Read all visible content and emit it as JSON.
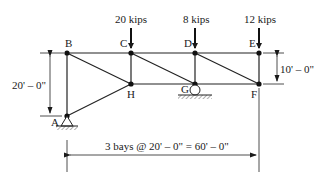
{
  "diagram": {
    "type": "truss",
    "nodes": [
      {
        "id": "A",
        "label": "A",
        "x": 67,
        "y": 116,
        "support": "pin"
      },
      {
        "id": "B",
        "label": "B",
        "x": 67,
        "y": 53
      },
      {
        "id": "C",
        "label": "C",
        "x": 131,
        "y": 53
      },
      {
        "id": "D",
        "label": "D",
        "x": 195,
        "y": 53
      },
      {
        "id": "E",
        "label": "E",
        "x": 259,
        "y": 53
      },
      {
        "id": "F",
        "label": "F",
        "x": 259,
        "y": 84
      },
      {
        "id": "G",
        "label": "G",
        "x": 195,
        "y": 84,
        "support": "roller"
      },
      {
        "id": "H",
        "label": "H",
        "x": 131,
        "y": 84
      }
    ],
    "members": [
      [
        "A",
        "B"
      ],
      [
        "B",
        "C"
      ],
      [
        "C",
        "D"
      ],
      [
        "D",
        "E"
      ],
      [
        "E",
        "F"
      ],
      [
        "F",
        "G"
      ],
      [
        "G",
        "H"
      ],
      [
        "H",
        "A"
      ],
      [
        "B",
        "H"
      ],
      [
        "C",
        "H"
      ],
      [
        "C",
        "G"
      ],
      [
        "D",
        "G"
      ],
      [
        "D",
        "F"
      ]
    ],
    "loads": [
      {
        "node": "C",
        "label": "20 kips"
      },
      {
        "node": "D",
        "label": "8 kips"
      },
      {
        "node": "E",
        "label": "12 kips"
      }
    ],
    "dimensions": {
      "left_height": "20' – 0\"",
      "right_depth": "10' – 0\"",
      "span": "3 bays @ 20' – 0\" = 60' – 0\""
    }
  }
}
